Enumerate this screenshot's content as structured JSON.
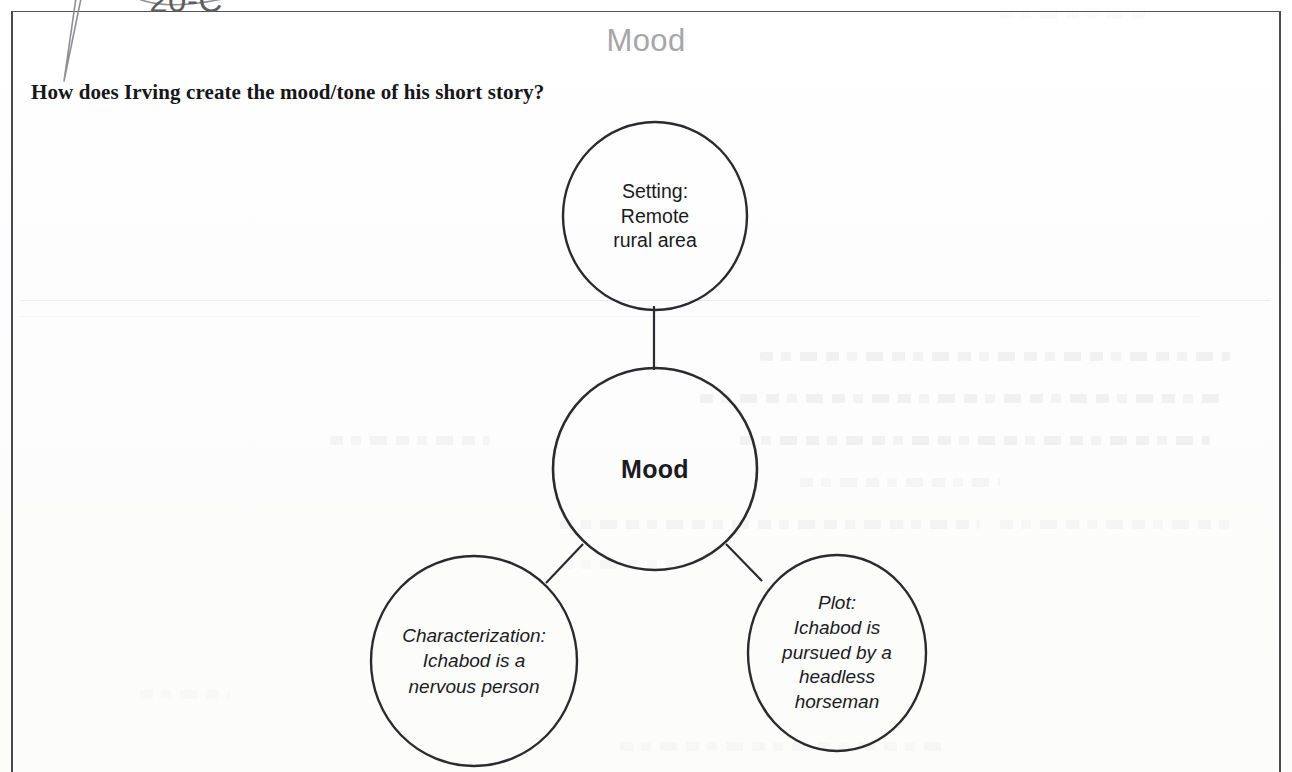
{
  "header": {
    "title": "Mood"
  },
  "callout": {
    "label": "20-C"
  },
  "prompt": {
    "question": "How does Irving create the mood/tone of his short story?"
  },
  "diagram": {
    "type": "bubble-map",
    "center": {
      "id": "mood",
      "label": "Mood"
    },
    "nodes": [
      {
        "id": "setting",
        "position": "top",
        "label": "Setting:\nRemote\nrural area",
        "lines": [
          "Setting:",
          "Remote",
          "rural area"
        ],
        "style": "upright"
      },
      {
        "id": "characterization",
        "position": "bottom-left",
        "label": "Characterization:\nIchabod is a\nnervous person",
        "lines": [
          "Characterization:",
          "Ichabod is a",
          "nervous person"
        ],
        "style": "italic"
      },
      {
        "id": "plot",
        "position": "bottom-right",
        "label": "Plot:\nIchabod is\npursued by a\nheadless\nhorseman",
        "lines": [
          "Plot:",
          "Ichabod is",
          "pursued by a",
          "headless",
          "horseman"
        ],
        "style": "italic"
      }
    ],
    "connections": [
      {
        "from": "setting",
        "to": "mood"
      },
      {
        "from": "mood",
        "to": "characterization"
      },
      {
        "from": "mood",
        "to": "plot"
      }
    ]
  },
  "colors": {
    "ink": "#1b1b1f",
    "stroke": "#2b2b2f",
    "title_gray": "#a6a6a8",
    "frame": "#4a4a4e",
    "paper": "#fefefe"
  }
}
